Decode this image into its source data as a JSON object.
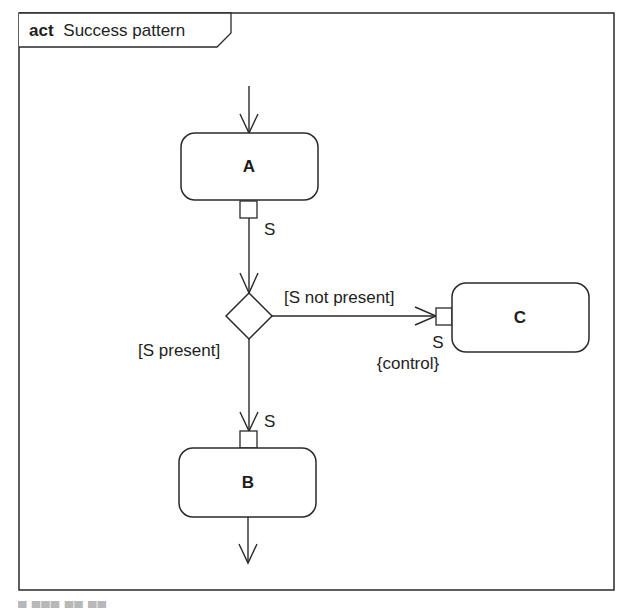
{
  "frame": {
    "keyword": "act",
    "title": "Success pattern"
  },
  "nodes": {
    "a": {
      "label": "A"
    },
    "b": {
      "label": "B"
    },
    "c": {
      "label": "C"
    }
  },
  "pins": {
    "a_output": {
      "label": "S"
    },
    "b_input": {
      "label": "S"
    },
    "c_input": {
      "label": "S",
      "stereotype": "{control}"
    }
  },
  "guards": {
    "not_present": "[S not present]",
    "present": "[S present]"
  },
  "colors": {
    "line": "#2a2a2a",
    "background": "#ffffff",
    "text": "#1e1e1e"
  }
}
